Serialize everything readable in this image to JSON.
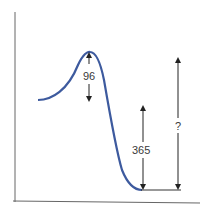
{
  "diagram": {
    "type": "energy-profile",
    "colors": {
      "curve": "#3d5a9e",
      "axes": "#555555",
      "arrows": "#222222"
    },
    "labels": {
      "activation_energy": "96",
      "product_drop": "365",
      "unknown": "?"
    }
  }
}
